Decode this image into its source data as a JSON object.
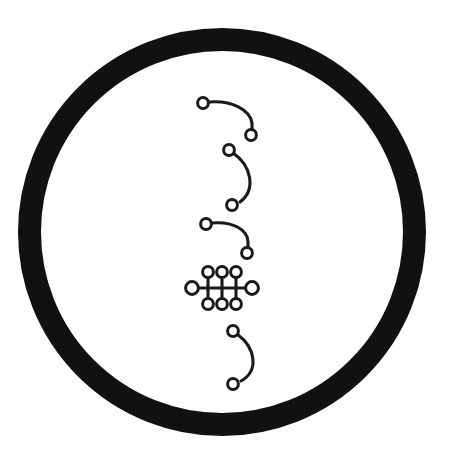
{
  "figure": {
    "canvas": {
      "width": 457,
      "height": 470,
      "background": "#ffffff"
    }
  },
  "colors": {
    "ink": "#1a1a1a",
    "ring": "#111111",
    "paper": "#ffffff",
    "node_fill": "#ffffff"
  },
  "ring": {
    "name": "outer-ring",
    "center_x": 222,
    "center_y": 232,
    "outer_radius": 204,
    "stroke_width": 23,
    "stroke_radius": 192.5
  },
  "glyph_strokes": {
    "curve_width": 3.1,
    "node_radius": 5.2,
    "node_stroke_width": 3.0
  },
  "glyphs": [
    {
      "id": "glyph-1",
      "name": "hook-down-right-upper",
      "order": 1,
      "shape": "hook",
      "path": "M 209 102 C 232 100 250 110 252 123 L 252 130",
      "nodes": [
        {
          "name": "node-start",
          "cx": 203,
          "cy": 103,
          "r": 5.4
        },
        {
          "name": "node-end",
          "cx": 251,
          "cy": 135,
          "r": 5.4
        }
      ]
    },
    {
      "id": "glyph-2",
      "name": "arc-bowed-right-upper",
      "order": 2,
      "shape": "arc",
      "path": "M 233 153 C 252 166 256 190 240 202",
      "nodes": [
        {
          "name": "node-start",
          "cx": 229,
          "cy": 150,
          "r": 5.4
        },
        {
          "name": "node-end",
          "cx": 232,
          "cy": 205,
          "r": 5.4
        }
      ]
    },
    {
      "id": "glyph-3",
      "name": "hook-down-right-lower",
      "order": 3,
      "shape": "hook",
      "path": "M 212 223 C 233 221 248 230 248 242 L 248 248",
      "nodes": [
        {
          "name": "node-start",
          "cx": 206,
          "cy": 224,
          "r": 5.4
        },
        {
          "name": "node-end",
          "cx": 247,
          "cy": 253,
          "r": 5.4
        }
      ]
    },
    {
      "id": "glyph-4",
      "name": "ladder-lattice",
      "order": 4,
      "shape": "lattice",
      "bar_y": 288,
      "bar_x_left": 196,
      "bar_x_right": 248,
      "rung_top_y": 276,
      "rung_bottom_y": 300,
      "rung_x": [
        208,
        222,
        236
      ],
      "nodes": [
        {
          "name": "node-bar-left",
          "cx": 192,
          "cy": 288,
          "r": 6.4
        },
        {
          "name": "node-bar-right",
          "cx": 252,
          "cy": 288,
          "r": 6.4
        },
        {
          "name": "node-top-1",
          "cx": 208,
          "cy": 272,
          "r": 5.4
        },
        {
          "name": "node-top-2",
          "cx": 222,
          "cy": 272,
          "r": 5.4
        },
        {
          "name": "node-top-3",
          "cx": 236,
          "cy": 272,
          "r": 5.4
        },
        {
          "name": "node-bottom-1",
          "cx": 208,
          "cy": 304,
          "r": 5.4
        },
        {
          "name": "node-bottom-2",
          "cx": 222,
          "cy": 304,
          "r": 5.4
        },
        {
          "name": "node-bottom-3",
          "cx": 236,
          "cy": 304,
          "r": 5.4
        }
      ]
    },
    {
      "id": "glyph-5",
      "name": "arc-bowed-right-lower",
      "order": 5,
      "shape": "arc",
      "path": "M 237 334 C 256 348 259 371 241 381",
      "nodes": [
        {
          "name": "node-start",
          "cx": 233,
          "cy": 331,
          "r": 5.4
        },
        {
          "name": "node-end",
          "cx": 233,
          "cy": 384,
          "r": 5.4
        }
      ]
    }
  ]
}
